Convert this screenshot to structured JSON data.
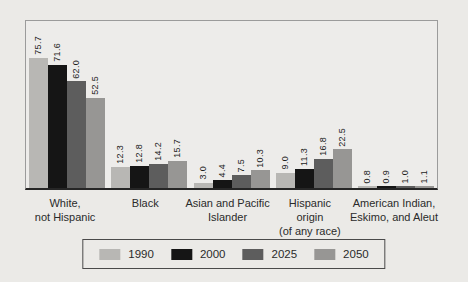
{
  "page": {
    "background": "#ebeae7"
  },
  "chart_data": {
    "type": "bar",
    "title": "",
    "xlabel": "",
    "ylabel": "",
    "ylim": [
      0,
      80
    ],
    "grid": false,
    "legend_position": "bottom",
    "value_label_format": "one-decimal-rotated-90",
    "categories": [
      "White,\nnot Hispanic",
      "Black",
      "Asian and Pacific\nIslander",
      "Hispanic\norigin\n(of any race)",
      "American Indian,\nEskimo, and Aleut"
    ],
    "series": [
      {
        "name": "1990",
        "color": "#b8b7b4",
        "values": [
          75.7,
          12.3,
          3.0,
          9.0,
          0.8
        ]
      },
      {
        "name": "2000",
        "color": "#151515",
        "values": [
          71.6,
          12.8,
          4.4,
          11.3,
          0.9
        ]
      },
      {
        "name": "2025",
        "color": "#5d5d5d",
        "values": [
          62.0,
          14.2,
          7.5,
          16.8,
          1.0
        ]
      },
      {
        "name": "2050",
        "color": "#979694",
        "values": [
          52.5,
          15.7,
          10.3,
          22.5,
          1.1
        ]
      }
    ],
    "axis_color": "#262626",
    "plot_border_color": "#9b9b9b"
  }
}
